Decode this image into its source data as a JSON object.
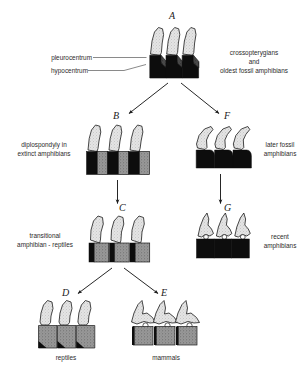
{
  "figure": {
    "title_letters": {
      "a": "A",
      "b": "B",
      "c": "C",
      "d": "D",
      "e": "E",
      "f": "F",
      "g": "G"
    },
    "annotations": {
      "pleurocentrum": "pleurocentrum",
      "hypocentrum": "hypocentrum"
    },
    "captions": {
      "a": "crossopterygians\nand\noldest fossil amphibians",
      "b": "diplospondyly in\nextinct amphibians",
      "c": "transitional\namphibian - reptiles",
      "d": "reptiles",
      "e": "mammals",
      "f": "later fossil\namphibians",
      "g": "recent\namphibians"
    },
    "colors": {
      "hypocentrum_black": "#0d0d0d",
      "pleurocentrum_gray": "#8a8a8a",
      "neural_arch_light": "#d9d9d9",
      "outline": "#1a1a1a",
      "background": "#ffffff",
      "text": "#2b2b2b"
    }
  }
}
